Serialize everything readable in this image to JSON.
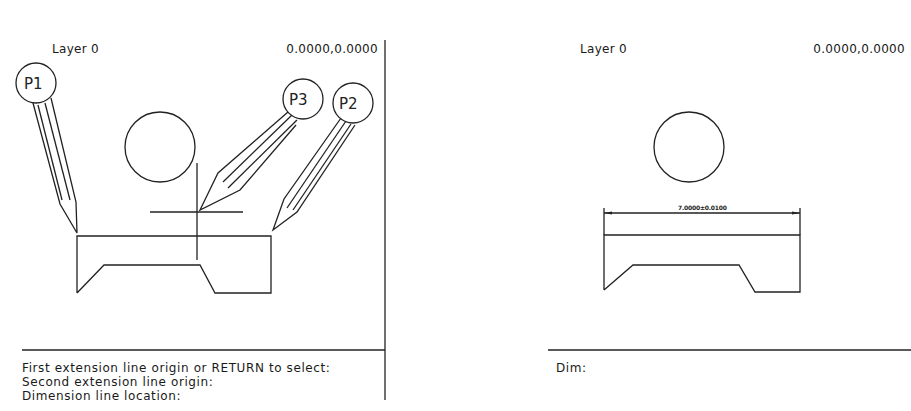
{
  "left_panel": {
    "layer_label": "Layer 0",
    "coordinates": "0.0000,0.0000",
    "pick_points": [
      {
        "label": "P1"
      },
      {
        "label": "P2"
      },
      {
        "label": "P3"
      }
    ],
    "command_lines": [
      "First extension line origin or RETURN to select:",
      "Second extension line origin:",
      "Dimension line location:"
    ]
  },
  "right_panel": {
    "layer_label": "Layer 0",
    "coordinates": "0.0000,0.0000",
    "dimension_text": "7.0000±0.0100",
    "command_prompt": "Dim:"
  },
  "colors": {
    "background": "#ffffff",
    "line": "#222222"
  }
}
